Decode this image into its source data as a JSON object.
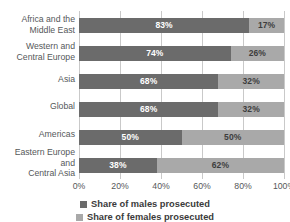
{
  "chart_data": {
    "type": "bar",
    "orientation": "horizontal",
    "stacked": true,
    "normalized_100pct": true,
    "title": "",
    "xlabel": "",
    "ylabel": "",
    "xlim": [
      0,
      100
    ],
    "grid": true,
    "legend_position": "bottom",
    "categories": [
      "Africa and the\nMiddle East",
      "Western and\nCentral Europe",
      "Asia",
      "Global",
      "Americas",
      "Eastern Europe and\nCentral Asia"
    ],
    "tick_labels": [
      "0%",
      "20%",
      "40%",
      "60%",
      "80%",
      "100%"
    ],
    "tick_values": [
      0,
      20,
      40,
      60,
      80,
      100
    ],
    "series": [
      {
        "name": "Share of males prosecuted",
        "color": "#6b6b6b",
        "values": [
          83,
          74,
          68,
          68,
          50,
          38
        ],
        "labels": [
          "83%",
          "74%",
          "68%",
          "68%",
          "50%",
          "38%"
        ]
      },
      {
        "name": "Share of females prosecuted",
        "color": "#a9a9a9",
        "values": [
          17,
          26,
          32,
          32,
          50,
          62
        ],
        "labels": [
          "17%",
          "26%",
          "32%",
          "32%",
          "50%",
          "62%"
        ]
      }
    ]
  },
  "legend": {
    "items": [
      {
        "label": "Share of males prosecuted",
        "color": "#6b6b6b"
      },
      {
        "label": "Share of females prosecuted",
        "color": "#a9a9a9"
      }
    ]
  },
  "colors": {
    "series_dark": "#6b6b6b",
    "series_light": "#a9a9a9",
    "gridline": "#c9c9c9",
    "axis": "#9b9b9b",
    "text": "#55585a",
    "background": "#ffffff"
  }
}
